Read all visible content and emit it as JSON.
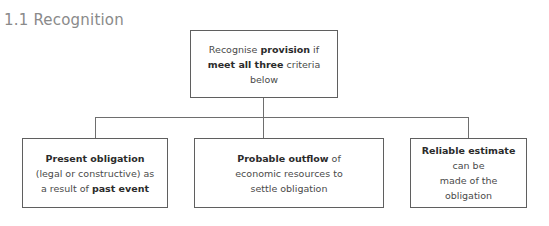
{
  "page": {
    "title": "1.1 Recognition",
    "background_color": "#ffffff",
    "title_color": "#8a8a8a",
    "box_border_color": "#5f5f5f",
    "connector_color": "#6e6e6e"
  },
  "diagram": {
    "type": "flowchart",
    "orientation": "top-down",
    "root": {
      "id": "recognition-criteria",
      "text_plain": "Recognise provision if meet all three criteria below",
      "lines": [
        [
          {
            "text": "Recognise ",
            "bold": false
          },
          {
            "text": "provision",
            "bold": true
          },
          {
            "text": " if",
            "bold": false
          }
        ],
        [
          {
            "text": "meet all three",
            "bold": true
          },
          {
            "text": " criteria",
            "bold": false
          }
        ],
        [
          {
            "text": "below",
            "bold": false
          }
        ]
      ]
    },
    "children": [
      {
        "id": "present-obligation",
        "text_plain": "Present obligation (legal or constructive) as a result of past event",
        "lines": [
          [
            {
              "text": "Present obligation",
              "bold": true
            }
          ],
          [
            {
              "text": "(legal or constructive) as",
              "bold": false
            }
          ],
          [
            {
              "text": "a result of ",
              "bold": false
            },
            {
              "text": "past event",
              "bold": true
            }
          ]
        ]
      },
      {
        "id": "probable-outflow",
        "text_plain": "Probable outflow of economic resources to settle obligation",
        "lines": [
          [
            {
              "text": "Probable outflow",
              "bold": true
            },
            {
              "text": " of",
              "bold": false
            }
          ],
          [
            {
              "text": "economic resources to",
              "bold": false
            }
          ],
          [
            {
              "text": "settle obligation",
              "bold": false
            }
          ]
        ]
      },
      {
        "id": "reliable-estimate",
        "text_plain": "Reliable estimate can be made of the obligation",
        "lines": [
          [
            {
              "text": "Reliable estimate",
              "bold": true
            },
            {
              "text": " can be",
              "bold": false
            }
          ],
          [
            {
              "text": "made of the obligation",
              "bold": false
            }
          ]
        ]
      }
    ]
  }
}
